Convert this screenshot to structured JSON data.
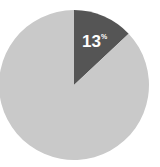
{
  "chart_data": {
    "type": "pie",
    "title": "",
    "slices": [
      {
        "label": "13%",
        "value": 13,
        "color": "#555555"
      },
      {
        "label": "",
        "value": 87,
        "color": "#c9c9c9"
      }
    ],
    "start_angle": "12 o'clock, clockwise",
    "legend": "none"
  },
  "labels": {
    "main": "13",
    "unit": "%"
  }
}
